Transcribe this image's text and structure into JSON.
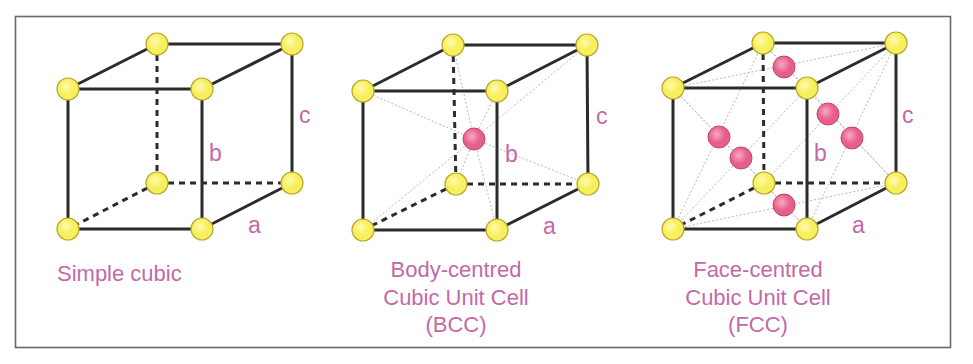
{
  "colors": {
    "corner_atom_fill": "#f7ef5e",
    "corner_atom_highlight": "#fffbb0",
    "corner_atom_stroke": "#b9a82e",
    "center_atom_fill": "#e65e8a",
    "center_atom_highlight": "#f9a9c2",
    "center_atom_stroke": "#c2466e",
    "label": "#c26aa8",
    "edge": "#2b2b2b"
  },
  "cells": [
    {
      "id": "simple-cubic",
      "caption_lines": [
        "Simple cubic"
      ],
      "caption_align": "start",
      "caption_x": 57,
      "caption_y": 281,
      "corners": {
        "ftl": [
          68,
          89
        ],
        "ftr": [
          202,
          89
        ],
        "fbl": [
          68,
          229
        ],
        "fbr": [
          202,
          229
        ],
        "btl": [
          157,
          44
        ],
        "btr": [
          292,
          44
        ],
        "bbl": [
          157,
          183
        ],
        "bbr": [
          292,
          183
        ]
      },
      "labels": {
        "a": {
          "text": "a",
          "x": 248,
          "y": 233
        },
        "b": {
          "text": "b",
          "x": 209,
          "y": 161
        },
        "c": {
          "text": "c",
          "x": 299,
          "y": 123
        }
      },
      "extra_atoms": [],
      "guides": []
    },
    {
      "id": "bcc",
      "caption_lines": [
        "Body-centred",
        "Cubic Unit Cell",
        "(BCC)"
      ],
      "caption_align": "middle",
      "caption_x": 456,
      "caption_y": 277,
      "corners": {
        "ftl": [
          363,
          91
        ],
        "ftr": [
          497,
          91
        ],
        "fbl": [
          363,
          230
        ],
        "fbr": [
          497,
          230
        ],
        "btl": [
          453,
          45
        ],
        "btr": [
          587,
          45
        ],
        "bbl": [
          456,
          184
        ],
        "bbr": [
          588,
          184
        ]
      },
      "labels": {
        "a": {
          "text": "a",
          "x": 543,
          "y": 234
        },
        "b": {
          "text": "b",
          "x": 505,
          "y": 162
        },
        "c": {
          "text": "c",
          "x": 596,
          "y": 124
        }
      },
      "extra_atoms": [
        [
          474,
          139
        ]
      ],
      "guides": [
        [
          [
            474,
            139
          ],
          [
            363,
            91
          ]
        ],
        [
          [
            474,
            139
          ],
          [
            497,
            91
          ]
        ],
        [
          [
            474,
            139
          ],
          [
            363,
            230
          ]
        ],
        [
          [
            474,
            139
          ],
          [
            497,
            230
          ]
        ],
        [
          [
            474,
            139
          ],
          [
            453,
            45
          ]
        ],
        [
          [
            474,
            139
          ],
          [
            587,
            45
          ]
        ],
        [
          [
            474,
            139
          ],
          [
            456,
            184
          ]
        ],
        [
          [
            474,
            139
          ],
          [
            588,
            184
          ]
        ]
      ]
    },
    {
      "id": "fcc",
      "caption_lines": [
        "Face-centred",
        "Cubic Unit Cell",
        "(FCC)"
      ],
      "caption_align": "middle",
      "caption_x": 758,
      "caption_y": 277,
      "corners": {
        "ftl": [
          673,
          88
        ],
        "ftr": [
          807,
          88
        ],
        "fbl": [
          673,
          229
        ],
        "fbr": [
          807,
          229
        ],
        "btl": [
          763,
          43
        ],
        "btr": [
          896,
          43
        ],
        "bbl": [
          764,
          183
        ],
        "bbr": [
          896,
          183
        ]
      },
      "labels": {
        "a": {
          "text": "a",
          "x": 852,
          "y": 233
        },
        "b": {
          "text": "b",
          "x": 814,
          "y": 161
        },
        "c": {
          "text": "c",
          "x": 902,
          "y": 123
        }
      },
      "extra_atoms": [
        [
          784,
          67
        ],
        [
          828,
          114
        ],
        [
          852,
          138
        ],
        [
          719,
          137
        ],
        [
          741,
          158
        ],
        [
          784,
          205
        ]
      ],
      "guides": [
        [
          [
            673,
            88
          ],
          [
            807,
            229
          ]
        ],
        [
          [
            807,
            88
          ],
          [
            673,
            229
          ]
        ],
        [
          [
            807,
            88
          ],
          [
            896,
            183
          ]
        ],
        [
          [
            896,
            43
          ],
          [
            807,
            229
          ]
        ],
        [
          [
            673,
            88
          ],
          [
            896,
            43
          ]
        ],
        [
          [
            763,
            43
          ],
          [
            807,
            88
          ]
        ],
        [
          [
            673,
            88
          ],
          [
            764,
            183
          ]
        ],
        [
          [
            763,
            43
          ],
          [
            673,
            229
          ]
        ],
        [
          [
            673,
            229
          ],
          [
            896,
            183
          ]
        ],
        [
          [
            764,
            183
          ],
          [
            807,
            229
          ]
        ],
        [
          [
            763,
            43
          ],
          [
            896,
            183
          ]
        ],
        [
          [
            896,
            43
          ],
          [
            764,
            183
          ]
        ]
      ]
    }
  ]
}
